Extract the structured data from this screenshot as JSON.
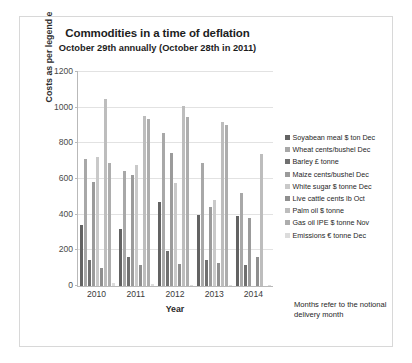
{
  "chart_data": {
    "type": "bar",
    "title": "Commodities in a time of deflation",
    "subtitle": "October 29th annually (October 28th in 2011)",
    "xlabel": "Year",
    "ylabel": "Costs as per legend e",
    "categories": [
      "2010",
      "2011",
      "2012",
      "2013",
      "2014"
    ],
    "ylim": [
      0,
      1200
    ],
    "yticks": [
      0,
      200,
      400,
      600,
      800,
      1000,
      1200
    ],
    "grid": true,
    "legend_position": "right",
    "note": "Months refer to the notional delivery month",
    "series": [
      {
        "name": "Soyabean meal $ ton Dec",
        "color": "#636363",
        "values": [
          340,
          320,
          470,
          400,
          390
        ]
      },
      {
        "name": "Wheat cents/bushel Dec",
        "color": "#a8a8a8",
        "values": [
          715,
          645,
          860,
          690,
          520
        ]
      },
      {
        "name": "Barley £ tonne",
        "color": "#707070",
        "values": [
          145,
          165,
          195,
          145,
          120
        ]
      },
      {
        "name": "Maize cents/bushel Dec",
        "color": "#9b9b9b",
        "values": [
          585,
          625,
          745,
          445,
          380
        ]
      },
      {
        "name": "White sugar $ tonne Dec",
        "color": "#c9c9c9",
        "values": [
          725,
          680,
          575,
          480,
          0
        ]
      },
      {
        "name": "Live cattle cents lb Oct",
        "color": "#8f8f8f",
        "values": [
          100,
          120,
          125,
          130,
          165
        ]
      },
      {
        "name": "Palm oil $ tonne",
        "color": "#bdbdbd",
        "values": [
          1050,
          955,
          1010,
          920,
          740
        ]
      },
      {
        "name": "Gas oil IPE $ tonne Nov",
        "color": "#adadad",
        "values": [
          690,
          935,
          945,
          905,
          0
        ]
      },
      {
        "name": "Emissions € tonne Dec",
        "color": "#dcdcdc",
        "values": [
          15,
          12,
          8,
          5,
          7
        ]
      }
    ]
  }
}
